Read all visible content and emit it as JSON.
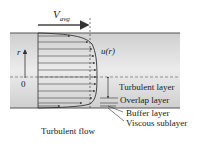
{
  "diagram": {
    "title": "Turbulent flow",
    "labels": {
      "v_avg_main": "V",
      "v_avg_sub": "avg",
      "r_axis": "r",
      "origin": "0",
      "velocity_profile": "u(r)"
    },
    "layers": [
      {
        "name": "Turbulent layer"
      },
      {
        "name": "Overlap layer"
      },
      {
        "name": "Buffer layer"
      },
      {
        "name": "Viscous sublayer"
      }
    ],
    "colors": {
      "pipe_fill": "#dcdcdc",
      "wall": "#555555",
      "lines": "#333333"
    }
  }
}
